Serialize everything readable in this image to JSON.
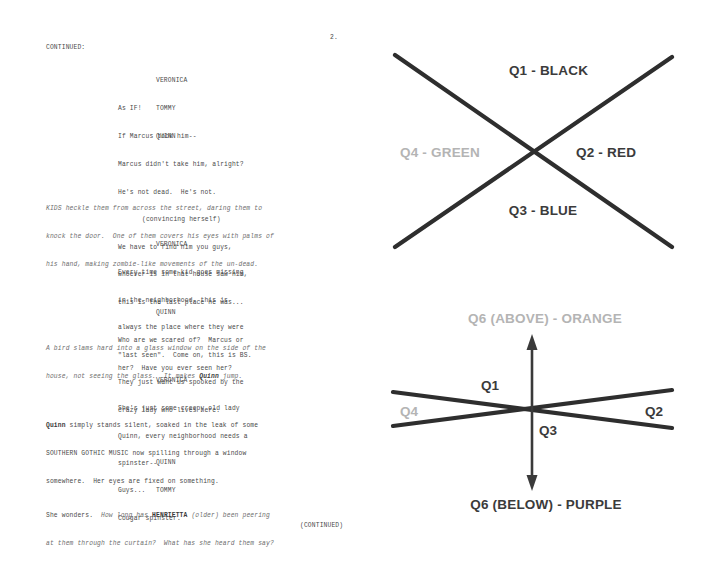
{
  "screenplay": {
    "page_number": "2.",
    "continued_header": "CONTINUED:",
    "footer": "(CONTINUED)",
    "blocks": [
      {
        "cue": "VERONICA",
        "lines": [
          "As IF!"
        ]
      },
      {
        "cue": "TOMMY",
        "lines": [
          "If Marcus took him--"
        ]
      },
      {
        "cue": "QUINN",
        "lines": [
          "Marcus didn't take him, alright?",
          "He's not dead.  He's not."
        ],
        "paren": "(convincing herself)",
        "lines2": [
          "We have to find him you guys,",
          "whoever is in that house saw him,",
          "this is the last place he was..."
        ]
      },
      {
        "action_italic": [
          "KIDS heckle them from across the street, daring them to",
          "knock the door.  One of them covers his eyes with palms of",
          "his hand, making zombie-like movements of the un-dead."
        ]
      },
      {
        "cue": "VERONICA",
        "lines": [
          "Every time some kid goes missing",
          "in the neighborhood, this is",
          "always the place where they were",
          "\"last seen\".  Come on, this is BS.",
          "They just want us spooked by the",
          "crazy lady who lives here."
        ]
      },
      {
        "cue": "QUINN",
        "lines": [
          "Who are we scared of?  Marcus or",
          "her?  Have you ever seen her?"
        ]
      },
      {
        "action_italic": [
          "A bird slams hard into a glass window on the side of the",
          "house, not seeing the glass.  It makes Quinn jump."
        ]
      },
      {
        "cue": "VERONICA",
        "lines": [
          "She's just some creepy old lady",
          "Quinn, every neighborhood needs a",
          "spinster--"
        ]
      },
      {
        "action_mixed": [
          "Quinn simply stands silent, soaked in the leak of some",
          "SOUTHERN GOTHIC MUSIC now spilling through a window",
          "somewhere.  Her eyes are fixed on something."
        ]
      },
      {
        "cue": "QUINN",
        "lines": [
          "Guys..."
        ]
      },
      {
        "cue": "TOMMY",
        "lines": [
          "Cougar spinster."
        ]
      },
      {
        "action_final": [
          "She wonders.  How long has HENRIETTA (older) been peering",
          "at them through the curtain?  What has she heard them say?"
        ]
      }
    ],
    "text": {
      "b1_cue": "VERONICA",
      "b1_l1": "As IF!",
      "b2_cue": "TOMMY",
      "b2_l1": "If Marcus took him--",
      "b3_cue": "QUINN",
      "b3_l1": "Marcus didn't take him, alright?",
      "b3_l2": "He's not dead.  He's not.",
      "b3_paren": "(convincing herself)",
      "b3_l3": "We have to find him you guys,",
      "b3_l4": "whoever is in that house saw him,",
      "b3_l5": "this is the last place he was...",
      "b4_l1": "KIDS heckle them from across the street, daring them to",
      "b4_l2": "knock the door.  One of them covers his eyes with palms of",
      "b4_l3": "his hand, making zombie-like movements of the un-dead.",
      "b5_cue": "VERONICA",
      "b5_l1": "Every time some kid goes missing",
      "b5_l2": "in the neighborhood, this is",
      "b5_l3": "always the place where they were",
      "b5_l4": "\"last seen\".  Come on, this is BS.",
      "b5_l5": "They just want us spooked by the",
      "b5_l6": "crazy lady who lives here.",
      "b6_cue": "QUINN",
      "b6_l1": "Who are we scared of?  Marcus or",
      "b6_l2": "her?  Have you ever seen her?",
      "b7_l1": "A bird slams hard into a glass window on the side of the",
      "b7_l2a": "house, not seeing the glass.  It makes ",
      "b7_l2b": "Quinn",
      "b7_l2c": " jump.",
      "b8_cue": "VERONICA",
      "b8_l1": "She's just some creepy old lady",
      "b8_l2": "Quinn, every neighborhood needs a",
      "b8_l3": "spinster--",
      "b9_l1a": "Quinn",
      "b9_l1b": " simply stands silent, soaked in the leak of some",
      "b9_l2": "SOUTHERN GOTHIC MUSIC now spilling through a window",
      "b9_l3": "somewhere.  Her eyes are fixed on something.",
      "b10_cue": "QUINN",
      "b10_l1": "Guys...",
      "b11_cue": "TOMMY",
      "b11_l1": "Cougar spinster.",
      "b12_l1a": "She wonders.  ",
      "b12_l1b": "How long has ",
      "b12_l1c": "HENRIETTA",
      "b12_l1d": " (older) ",
      "b12_l1e": "been peering",
      "b12_l2": "at them through the curtain?  What has she heard them say?"
    }
  },
  "diagrams": {
    "upper": {
      "name": "four-quadrant-x-diagram",
      "labels": {
        "q1": "Q1 - BLACK",
        "q2": "Q2 - RED",
        "q3": "Q3 - BLUE",
        "q4": "Q4 - GREEN"
      },
      "line_color": "#2e2e2e"
    },
    "lower": {
      "name": "six-quadrant-axis-diagram",
      "labels": {
        "q6_above": "Q6 (ABOVE) - ORANGE",
        "q6_below": "Q6 (BELOW) - PURPLE",
        "q1": "Q1",
        "q2": "Q2",
        "q3": "Q3",
        "q4": "Q4"
      },
      "line_color": "#2e2e2e"
    },
    "colors": {
      "label_dark": "#3b3b3b",
      "label_light": "#b4b4b4",
      "background": "#ffffff"
    }
  }
}
